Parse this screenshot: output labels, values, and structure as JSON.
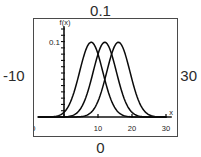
{
  "figure": {
    "outer_labels": {
      "top": "0.1",
      "left": "-10",
      "right": "30",
      "bottom": "0"
    }
  },
  "chart_data": {
    "type": "line",
    "title": "",
    "xlabel": "x",
    "ylabel": "f(x)",
    "xlim": [
      -10,
      30
    ],
    "ylim": [
      0,
      0.115
    ],
    "grid": false,
    "legend": "none",
    "x_ticks": [
      -10,
      0,
      10,
      20,
      30
    ],
    "x_tick_labels": [
      "-10",
      "",
      "10",
      "20",
      "30"
    ],
    "y_ticks": [
      0.1
    ],
    "y_tick_labels": [
      "0.1"
    ],
    "annotations": [
      "f(x)",
      "x",
      "0.1"
    ],
    "series": [
      {
        "name": "curve-1",
        "shape": "gaussian",
        "mean": 8,
        "sigma": 3.4,
        "peak": 0.1
      },
      {
        "name": "curve-2",
        "shape": "gaussian",
        "mean": 12,
        "sigma": 3.4,
        "peak": 0.1
      },
      {
        "name": "curve-3",
        "shape": "gaussian",
        "mean": 16,
        "sigma": 3.4,
        "peak": 0.1
      }
    ]
  }
}
